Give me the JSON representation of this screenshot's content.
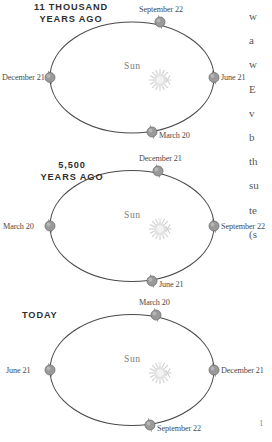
{
  "figure": {
    "type": "astronomy-orbit-diagram-series",
    "panel_count": 3,
    "colors": {
      "orbit_line": "#4a4a4a",
      "earth_marker": "#9a9a9a",
      "earth_marker_dark": "#6e6e6e",
      "sun_glyph": "#c9c9c9",
      "caption_text": "#2f2f2f",
      "label_text": "#4a4a4a",
      "sun_label_text": "#7a7a7a",
      "body_text": "#5a5a5a",
      "background": "#ffffff"
    },
    "sun_label": "Sun",
    "sun_icon": "sunburst-icon",
    "earth_icon": "earth-sphere-with-tilted-axis-icon"
  },
  "panels": [
    {
      "id": "panel-11-thousand-years-ago",
      "caption": "11 THOUSAND\nYEARS AGO",
      "sun_label": "Sun",
      "positions": {
        "top": "September 22",
        "right": "June 21",
        "bottom": "March 20",
        "left": "December 21"
      }
    },
    {
      "id": "panel-5500-years-ago",
      "caption": "5,500\nYEARS AGO",
      "sun_label": "Sun",
      "positions": {
        "top": "December 21",
        "right": "September 22",
        "bottom": "June 21",
        "left": "March 20"
      }
    },
    {
      "id": "panel-today",
      "caption": "TODAY",
      "sun_label": "Sun",
      "positions": {
        "top": "March 20",
        "right": "December 21",
        "bottom": "September 22",
        "left": "June 21"
      }
    }
  ],
  "text_column": {
    "lines": [
      "w",
      "a",
      "w",
      "E",
      "v",
      "b",
      "th",
      "su",
      "te",
      "(s"
    ]
  },
  "folio": "1"
}
